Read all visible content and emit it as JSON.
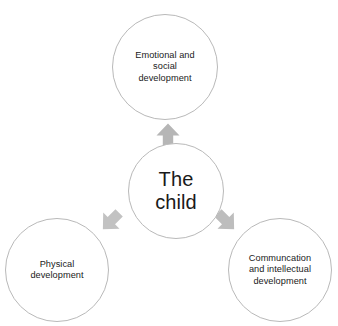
{
  "diagram": {
    "type": "radial-hub-and-spoke",
    "background_color": "#ffffff",
    "circle_stroke_color": "#b9b9b9",
    "arrow_color": "#b3b3b3",
    "text_color": "#1a1a1a",
    "center": {
      "id": "center-node",
      "label": "The\nchild",
      "cx": 176,
      "cy": 191,
      "r": 48
    },
    "nodes": [
      {
        "id": "node-emotional-social",
        "name": "emotional-and-social-development",
        "label": "Emotional and\nsocial\ndevelopment",
        "cx": 165,
        "cy": 67,
        "r": 53
      },
      {
        "id": "node-physical",
        "name": "physical-development",
        "label": "Physical\ndevelopment",
        "cx": 57,
        "cy": 270,
        "r": 52
      },
      {
        "id": "node-communication-intellectual",
        "name": "communication-and-intellectual-development",
        "label": "Communcation\nand intellectual\ndevelopment",
        "cx": 280,
        "cy": 270,
        "r": 52
      }
    ],
    "arrows": [
      {
        "id": "arrow-up",
        "name": "arrow-up-to-emotional-social",
        "direction": "up",
        "from": "center-node",
        "to": "node-emotional-social",
        "cx": 168,
        "cy": 135,
        "size": 23,
        "rotation": 0,
        "color": "#b6b6b6"
      },
      {
        "id": "arrow-down-left",
        "name": "arrow-down-left-to-physical",
        "direction": "down-left",
        "from": "center-node",
        "to": "node-physical",
        "cx": 111,
        "cy": 221,
        "size": 23,
        "rotation": -135,
        "color": "#c2c2c2"
      },
      {
        "id": "arrow-down-right",
        "name": "arrow-down-right-to-communication-intellectual",
        "direction": "down-right",
        "from": "center-node",
        "to": "node-communication-intellectual",
        "cx": 226,
        "cy": 221,
        "size": 23,
        "rotation": 135,
        "color": "#bdbdbd"
      }
    ]
  }
}
